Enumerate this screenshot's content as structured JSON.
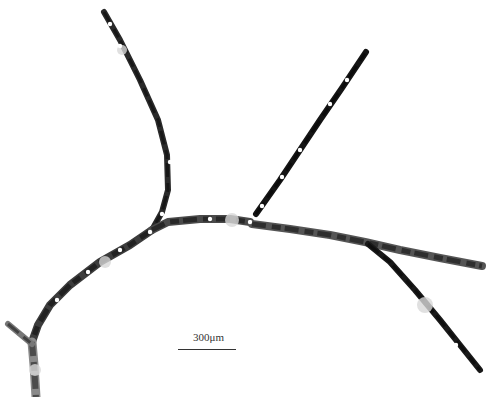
{
  "image": {
    "subject": "branching filamentous hyphae micrograph (grayscale)",
    "background": "#ffffff",
    "filament_dark": "#111111",
    "filament_mid": "#555555",
    "filament_light": "#9a9a9a"
  },
  "scale_bar": {
    "label": "300μm",
    "x1": 178,
    "x2": 236,
    "y": 349,
    "label_x": 193,
    "label_y": 331
  },
  "filaments": [
    {
      "name": "upper-left-branch",
      "points": "104,12 120,40 140,80 158,120 167,155 168,190 162,212 152,230",
      "width": 6,
      "shade": "#2a2a2a"
    },
    {
      "name": "lower-left-branch",
      "points": "152,230 130,245 100,262 70,285 50,305 38,325 32,342",
      "width": 8,
      "shade": "#3c3c3c"
    },
    {
      "name": "basal-stem",
      "points": "32,342 34,365 36,397",
      "width": 9,
      "shade": "#8a8a8a"
    },
    {
      "name": "basal-spur",
      "points": "8,324 20,334 32,344",
      "width": 6,
      "shade": "#777777"
    },
    {
      "name": "central-segment",
      "points": "152,230 168,222 200,219 230,219 250,222",
      "width": 8,
      "shade": "#4a4a4a"
    },
    {
      "name": "main-right-branch",
      "points": "252,224 290,229 330,235 365,242 400,250 440,258 482,266",
      "width": 8,
      "shade": "#555555"
    },
    {
      "name": "upper-right-branch",
      "points": "256,214 280,180 300,150 320,120 342,88 366,52",
      "width": 6,
      "shade": "#151515"
    },
    {
      "name": "lower-right-branch",
      "points": "368,244 390,262 415,290 440,320 460,345 480,370",
      "width": 6,
      "shade": "#1a1a1a"
    }
  ],
  "septa_gaps": [
    {
      "x": 110,
      "y": 24
    },
    {
      "x": 120,
      "y": 46
    },
    {
      "x": 170,
      "y": 162
    },
    {
      "x": 162,
      "y": 214
    },
    {
      "x": 150,
      "y": 232
    },
    {
      "x": 120,
      "y": 250
    },
    {
      "x": 88,
      "y": 272
    },
    {
      "x": 57,
      "y": 300
    },
    {
      "x": 210,
      "y": 219
    },
    {
      "x": 250,
      "y": 222
    },
    {
      "x": 347,
      "y": 80
    },
    {
      "x": 330,
      "y": 104
    },
    {
      "x": 300,
      "y": 150
    },
    {
      "x": 282,
      "y": 177
    },
    {
      "x": 262,
      "y": 206
    },
    {
      "x": 430,
      "y": 320
    },
    {
      "x": 456,
      "y": 345
    }
  ],
  "light_patches": [
    {
      "x": 122,
      "y": 50,
      "r": 5
    },
    {
      "x": 232,
      "y": 220,
      "r": 7
    },
    {
      "x": 425,
      "y": 305,
      "r": 8
    },
    {
      "x": 105,
      "y": 262,
      "r": 6
    },
    {
      "x": 35,
      "y": 370,
      "r": 6
    }
  ]
}
